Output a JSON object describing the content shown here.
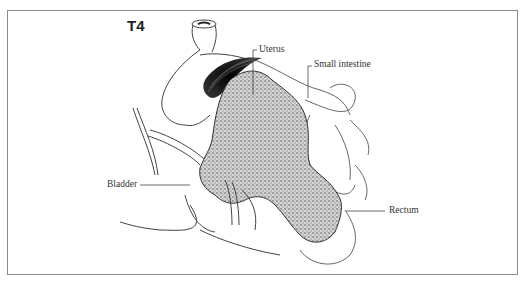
{
  "figure": {
    "stage_label": "T4",
    "labels": {
      "uterus": "Uterus",
      "small_intestine": "Small intestine",
      "bladder": "Bladder",
      "rectum": "Rectum"
    }
  },
  "colors": {
    "frame": "#8a8a8a",
    "line": "#333333",
    "tumor_fill": "#b8b8b8",
    "uterus_dark": "#1a1a1a"
  }
}
